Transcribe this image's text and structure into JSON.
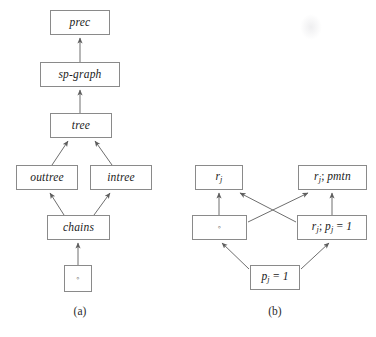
{
  "figure": {
    "background_color": "#ffffff",
    "line_color": "#6e6e6e",
    "box_border_color": "#8a8a8a",
    "text_color": "#1b1b1b"
  },
  "subfigures": [
    {
      "id": "a",
      "caption": "(a)",
      "type": "hasse-diagram",
      "nodes": [
        {
          "id": "prec",
          "label": "prec",
          "x": 50,
          "y": 10,
          "w": 60,
          "h": 25
        },
        {
          "id": "sp-graph",
          "label": "sp-graph",
          "x": 40,
          "y": 62,
          "w": 80,
          "h": 25
        },
        {
          "id": "tree",
          "label": "tree",
          "x": 50,
          "y": 113,
          "w": 62,
          "h": 25
        },
        {
          "id": "outtree",
          "label": "outtree",
          "x": 16,
          "y": 165,
          "w": 62,
          "h": 25
        },
        {
          "id": "intree",
          "label": "intree",
          "x": 90,
          "y": 165,
          "w": 62,
          "h": 25
        },
        {
          "id": "chains",
          "label": "chains",
          "x": 47,
          "y": 215,
          "w": 63,
          "h": 25
        },
        {
          "id": "empty",
          "label": "◦",
          "x": 64,
          "y": 265,
          "w": 28,
          "h": 27
        }
      ],
      "edges": [
        {
          "from": "sp-graph",
          "to": "prec"
        },
        {
          "from": "tree",
          "to": "sp-graph"
        },
        {
          "from": "outtree",
          "to": "tree"
        },
        {
          "from": "intree",
          "to": "tree"
        },
        {
          "from": "chains",
          "to": "outtree"
        },
        {
          "from": "chains",
          "to": "intree"
        },
        {
          "from": "empty",
          "to": "chains"
        }
      ]
    },
    {
      "id": "b",
      "caption": "(b)",
      "type": "hasse-diagram",
      "nodes": [
        {
          "id": "rj",
          "label_html": "r<sub>j</sub>",
          "label_text": "r_j",
          "x": 195,
          "y": 165,
          "w": 48,
          "h": 25
        },
        {
          "id": "rj-pmtn",
          "label_html": "r<sub>j</sub><span class=\"op\">;</span> pmtn",
          "label_text": "r_j; pmtn",
          "x": 298,
          "y": 165,
          "w": 69,
          "h": 25
        },
        {
          "id": "empty",
          "label_html": "◦",
          "label_text": "◦",
          "x": 192,
          "y": 215,
          "w": 55,
          "h": 25
        },
        {
          "id": "rj-pj1",
          "label_html": "r<sub>j</sub><span class=\"op\">;</span> p<sub>j</sub> <span class=\"op\">=</span> 1",
          "label_text": "r_j; p_j = 1",
          "x": 297,
          "y": 215,
          "w": 70,
          "h": 25
        },
        {
          "id": "pj1",
          "label_html": "p<sub>j</sub> <span class=\"op\">=</span> 1",
          "label_text": "p_j = 1",
          "x": 250,
          "y": 265,
          "w": 50,
          "h": 25
        }
      ],
      "edges": [
        {
          "from": "empty",
          "to": "rj"
        },
        {
          "from": "empty",
          "to": "rj-pmtn"
        },
        {
          "from": "rj-pj1",
          "to": "rj"
        },
        {
          "from": "rj-pj1",
          "to": "rj-pmtn"
        },
        {
          "from": "pj1",
          "to": "empty"
        },
        {
          "from": "pj1",
          "to": "rj-pj1"
        }
      ]
    }
  ]
}
